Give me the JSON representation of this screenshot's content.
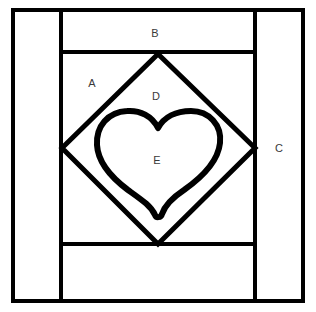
{
  "figure": {
    "name": "heart-in-diamond-quilt-block-diagram",
    "background_color": "#ffffff",
    "line_color": "#000000",
    "label_color": "#3a3a3a",
    "width": 316,
    "height": 312,
    "labels": [
      {
        "id": "A",
        "text": "A",
        "x": 92,
        "y": 83,
        "region": "corner-triangle-area"
      },
      {
        "id": "B",
        "text": "B",
        "x": 155,
        "y": 33,
        "region": "top-sash-strip"
      },
      {
        "id": "C",
        "text": "C",
        "x": 279,
        "y": 148,
        "region": "right-border-strip"
      },
      {
        "id": "D",
        "text": "D",
        "x": 156,
        "y": 96,
        "region": "diamond-background"
      },
      {
        "id": "E",
        "text": "E",
        "x": 157,
        "y": 160,
        "region": "heart-applique"
      }
    ],
    "geometry": {
      "outer_frame": {
        "x": 11,
        "y": 8,
        "width": 294,
        "height": 295,
        "stroke": 4
      },
      "left_divider_x": 61,
      "right_divider_x": 255,
      "top_divider_y": 52,
      "bottom_divider_y": 244,
      "diamond": {
        "top": [
          158,
          54
        ],
        "left": [
          62,
          148
        ],
        "right": [
          255,
          148
        ],
        "bottom": [
          158,
          244
        ],
        "stroke": 5
      },
      "heart": {
        "center_x": 158,
        "top_y": 112,
        "bottom_y": 215,
        "left_x": 97,
        "right_x": 220,
        "stroke": 6
      }
    }
  }
}
